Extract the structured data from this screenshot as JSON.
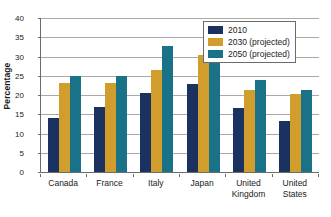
{
  "chart_data": {
    "type": "bar",
    "title": "",
    "xlabel": "",
    "ylabel": "Percentage",
    "ylim": [
      0,
      40
    ],
    "yticks": [
      0,
      5,
      10,
      15,
      20,
      25,
      30,
      35,
      40
    ],
    "grid": true,
    "legend_position": "top-right",
    "categories": [
      "Canada",
      "France",
      "Italy",
      "Japan",
      "United Kingdom",
      "United States"
    ],
    "category_lines": [
      [
        "Canada"
      ],
      [
        "France"
      ],
      [
        "Italy"
      ],
      [
        "Japan"
      ],
      [
        "United",
        "Kingdom"
      ],
      [
        "United",
        "States"
      ]
    ],
    "series": [
      {
        "name": "2010",
        "color": "#1b3160",
        "values": [
          14.1,
          16.8,
          20.5,
          22.8,
          16.7,
          13.3
        ]
      },
      {
        "name": "2030 (projected)",
        "color": "#d19d2c",
        "values": [
          23.0,
          23.1,
          26.5,
          30.4,
          21.2,
          20.2
        ]
      },
      {
        "name": "2050 (projected)",
        "color": "#1a7289",
        "values": [
          24.9,
          25.0,
          32.8,
          35.7,
          23.8,
          21.4
        ]
      }
    ]
  },
  "axis": {
    "y_title": "Percentage"
  },
  "colors": {
    "series_2010": "#1b3160",
    "series_2030": "#d19d2c",
    "series_2050": "#1a7289",
    "gridline": "#a9a9a9",
    "axis": "#6b6b6b",
    "text": "#1a1a1a",
    "background": "#ffffff"
  }
}
